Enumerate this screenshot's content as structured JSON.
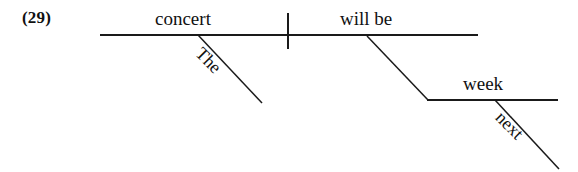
{
  "example": {
    "number_label": "(29)"
  },
  "diagram": {
    "type": "reed-kellogg-sentence-diagram",
    "sentence": "The concert will be next week",
    "ink_color": "#1a1a1a",
    "background_color": "#ffffff",
    "words": {
      "subject": "concert",
      "subject_determiner": "The",
      "verb": "will be",
      "complement": "week",
      "complement_modifier": "next"
    },
    "lines": {
      "baseline": {
        "x1": 100,
        "y1": 35,
        "x2": 478,
        "y2": 35
      },
      "subject_verb_divider": {
        "x1": 288,
        "y1": 13,
        "x2": 288,
        "y2": 49
      },
      "determiner_slant": {
        "x1": 198,
        "y1": 35,
        "x2": 262,
        "y2": 103
      },
      "complement_slant": {
        "x1": 367,
        "y1": 36,
        "x2": 428,
        "y2": 100
      },
      "complement_baseline": {
        "x1": 428,
        "y1": 100,
        "x2": 558,
        "y2": 100
      },
      "modifier_slant": {
        "x1": 495,
        "y1": 100,
        "x2": 558,
        "y2": 168
      }
    }
  }
}
